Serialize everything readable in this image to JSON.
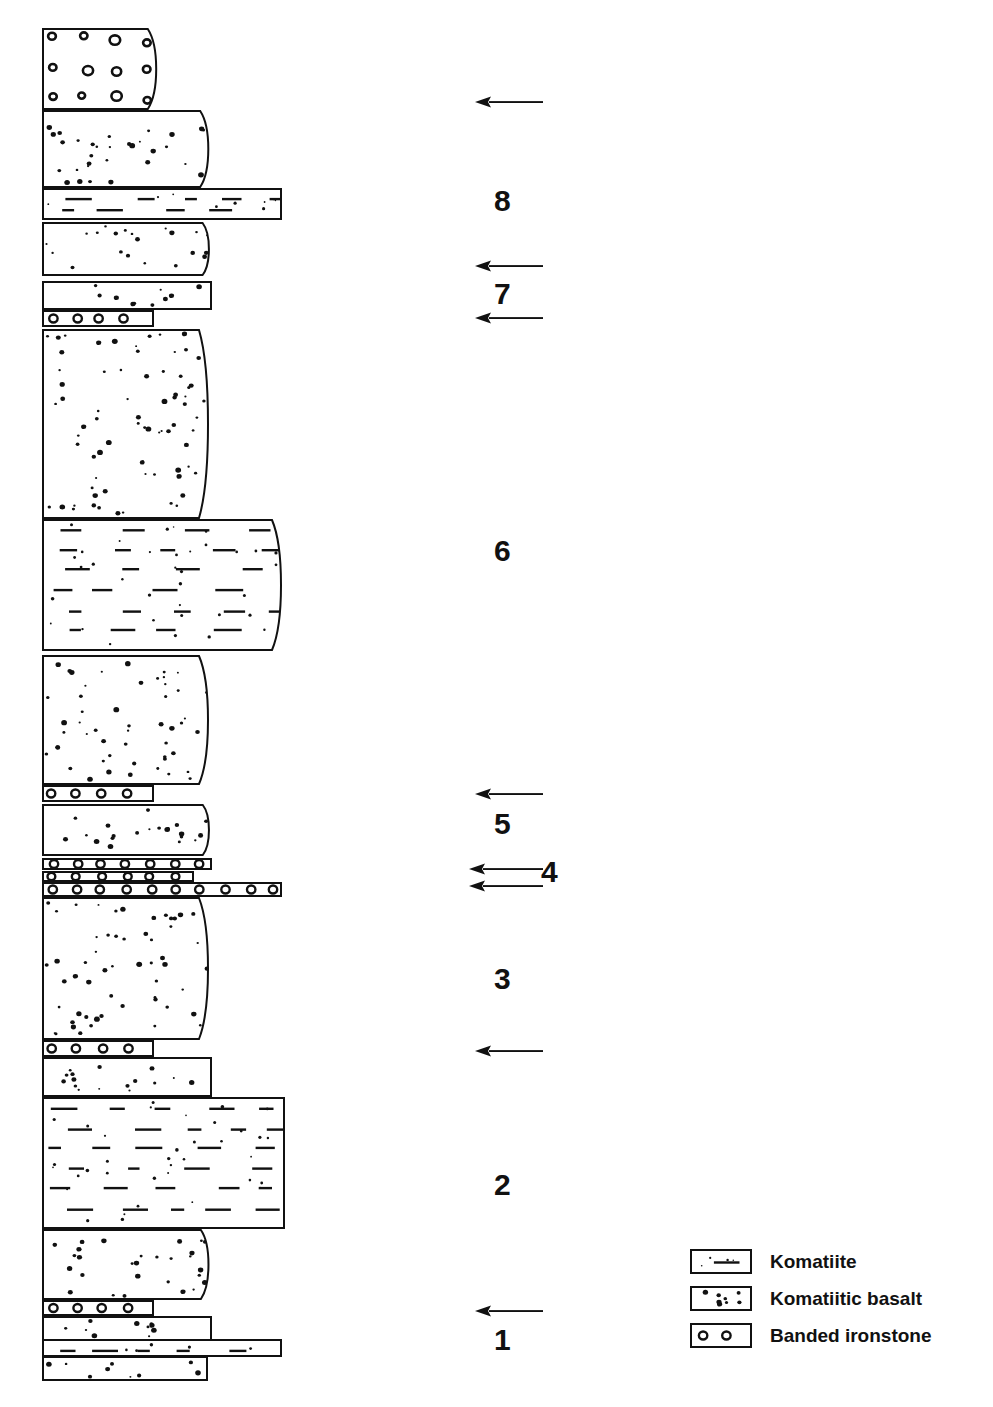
{
  "figure": {
    "type": "stratigraphic-column",
    "title": "",
    "caption": ""
  },
  "units": [
    {
      "id": "u14",
      "label": "banded ironstone",
      "lithology": "Banded ironstone",
      "x": 42,
      "y": 28,
      "w": 118,
      "h": 82,
      "right_edge": "curved"
    },
    {
      "id": "u13",
      "label": "komatiitic basalt",
      "lithology": "Komatiitic basalt",
      "x": 42,
      "y": 110,
      "w": 170,
      "h": 78,
      "right_edge": "curved"
    },
    {
      "id": "u12",
      "label": "komatiite",
      "lithology": "Komatiite",
      "x": 42,
      "y": 188,
      "w": 240,
      "h": 32,
      "right_edge": "straight"
    },
    {
      "id": "u11",
      "label": "komatiitic basalt",
      "lithology": "Komatiitic basalt",
      "x": 42,
      "y": 222,
      "w": 170,
      "h": 54,
      "right_edge": "curved"
    },
    {
      "id": "u10",
      "label": "komatiitic basalt",
      "lithology": "Komatiitic basalt",
      "x": 42,
      "y": 281,
      "w": 170,
      "h": 29,
      "right_edge": "straight"
    },
    {
      "id": "u9",
      "label": "banded ironstone",
      "lithology": "Banded ironstone",
      "x": 42,
      "y": 310,
      "w": 112,
      "h": 17,
      "right_edge": "straight"
    },
    {
      "id": "u8",
      "label": "komatiitic basalt",
      "lithology": "Komatiitic basalt",
      "x": 42,
      "y": 329,
      "w": 170,
      "h": 190,
      "right_edge": "curved"
    },
    {
      "id": "u7",
      "label": "komatiite",
      "lithology": "Komatiite",
      "x": 42,
      "y": 519,
      "w": 243,
      "h": 132,
      "right_edge": "curved"
    },
    {
      "id": "u6",
      "label": "komatiitic basalt",
      "lithology": "Komatiitic basalt",
      "x": 42,
      "y": 655,
      "w": 170,
      "h": 130,
      "right_edge": "curved"
    },
    {
      "id": "u5",
      "label": "banded ironstone",
      "lithology": "Banded ironstone",
      "x": 42,
      "y": 785,
      "w": 112,
      "h": 17,
      "right_edge": "straight"
    },
    {
      "id": "u4",
      "label": "komatiitic basalt",
      "lithology": "Komatiitic basalt",
      "x": 42,
      "y": 804,
      "w": 170,
      "h": 52,
      "right_edge": "curved"
    },
    {
      "id": "u3b",
      "label": "banded ironstone",
      "lithology": "Banded ironstone",
      "x": 42,
      "y": 858,
      "w": 170,
      "h": 12,
      "right_edge": "straight"
    },
    {
      "id": "u3a",
      "label": "banded ironstone",
      "lithology": "Banded ironstone",
      "x": 42,
      "y": 871,
      "w": 152,
      "h": 11,
      "right_edge": "straight"
    },
    {
      "id": "u3",
      "label": "banded ironstone",
      "lithology": "Banded ironstone",
      "x": 42,
      "y": 882,
      "w": 240,
      "h": 15,
      "right_edge": "straight"
    },
    {
      "id": "u2",
      "label": "komatiitic basalt",
      "lithology": "Komatiitic basalt",
      "x": 42,
      "y": 897,
      "w": 170,
      "h": 143,
      "right_edge": "curved"
    },
    {
      "id": "u1c",
      "label": "banded ironstone",
      "lithology": "Banded ironstone",
      "x": 42,
      "y": 1040,
      "w": 112,
      "h": 17,
      "right_edge": "straight"
    },
    {
      "id": "u1b",
      "label": "komatiitic basalt",
      "lithology": "Komatiitic basalt",
      "x": 42,
      "y": 1057,
      "w": 170,
      "h": 40,
      "right_edge": "straight"
    },
    {
      "id": "u1a",
      "label": "komatiite",
      "lithology": "Komatiite",
      "x": 42,
      "y": 1097,
      "w": 243,
      "h": 132,
      "right_edge": "straight"
    },
    {
      "id": "u0c",
      "label": "komatiitic basalt",
      "lithology": "Komatiitic basalt",
      "x": 42,
      "y": 1229,
      "w": 170,
      "h": 71,
      "right_edge": "curved"
    },
    {
      "id": "u0b",
      "label": "banded ironstone",
      "lithology": "Banded ironstone",
      "x": 42,
      "y": 1300,
      "w": 112,
      "h": 16,
      "right_edge": "straight"
    },
    {
      "id": "u0a",
      "label": "komatiitic basalt",
      "lithology": "Komatiitic basalt",
      "x": 42,
      "y": 1316,
      "w": 170,
      "h": 26,
      "right_edge": "straight"
    },
    {
      "id": "u00",
      "label": "komatiite",
      "lithology": "Komatiite",
      "x": 42,
      "y": 1339,
      "w": 240,
      "h": 18,
      "right_edge": "straight"
    },
    {
      "id": "u000",
      "label": "komatiitic basalt",
      "lithology": "Komatiitic basalt",
      "x": 42,
      "y": 1356,
      "w": 166,
      "h": 25,
      "right_edge": "straight"
    }
  ],
  "cycle_numbers": [
    {
      "value": "8",
      "x": 494,
      "y": 186
    },
    {
      "value": "7",
      "x": 494,
      "y": 279
    },
    {
      "value": "6",
      "x": 494,
      "y": 536
    },
    {
      "value": "5",
      "x": 494,
      "y": 809
    },
    {
      "value": "4",
      "x": 541,
      "y": 857
    },
    {
      "value": "3",
      "x": 494,
      "y": 964
    },
    {
      "value": "2",
      "x": 494,
      "y": 1170
    },
    {
      "value": "1",
      "x": 494,
      "y": 1325
    }
  ],
  "arrows": [
    {
      "direction": "left",
      "x": 473,
      "y": 95,
      "length": 72
    },
    {
      "direction": "left",
      "x": 473,
      "y": 259,
      "length": 72
    },
    {
      "direction": "left",
      "x": 473,
      "y": 311,
      "length": 72
    },
    {
      "direction": "left",
      "x": 473,
      "y": 787,
      "length": 72
    },
    {
      "direction": "left",
      "x": 467,
      "y": 862,
      "length": 78
    },
    {
      "direction": "left",
      "x": 467,
      "y": 879,
      "length": 78
    },
    {
      "direction": "left",
      "x": 473,
      "y": 1044,
      "length": 72
    },
    {
      "direction": "left",
      "x": 473,
      "y": 1304,
      "length": 72
    }
  ],
  "legend": {
    "items": [
      {
        "key": "komatiite",
        "label": "Komatiite"
      },
      {
        "key": "komatiitic-basalt",
        "label": "Komatiitic basalt"
      },
      {
        "key": "banded-ironstone",
        "label": "Banded ironstone"
      }
    ]
  },
  "colors": {
    "ink": "#111111",
    "paper": "#ffffff"
  }
}
